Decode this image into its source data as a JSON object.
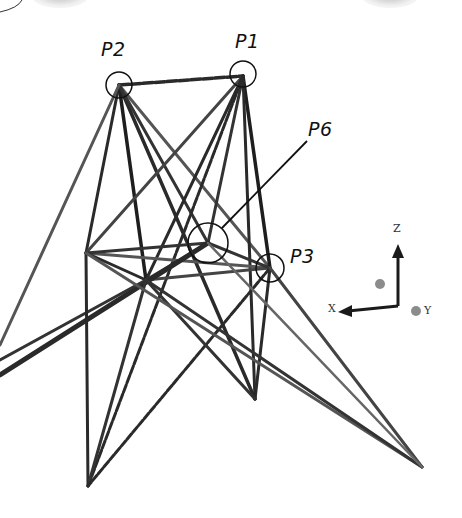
{
  "figure": {
    "type": "3d-truss-wireframe",
    "labels": {
      "p1": "P1",
      "p2": "P2",
      "p3": "P3",
      "p6": "P6"
    },
    "axes": {
      "x": "X",
      "y": "Y",
      "z": "Z"
    },
    "colors": {
      "member": "#2a2a2a",
      "member_light": "#777777",
      "axis_arrow": "#1a1a1a",
      "axis_ball": "#8c8c8c",
      "background": "#ffffff"
    },
    "nodes": [
      {
        "id": "P1",
        "x": 243,
        "y": 76,
        "circled": true
      },
      {
        "id": "P2",
        "x": 119,
        "y": 85,
        "circled": true
      },
      {
        "id": "P3",
        "x": 270,
        "y": 268,
        "circled": true
      },
      {
        "id": "P6",
        "x": 208,
        "y": 243,
        "circled": true
      },
      {
        "id": "N4",
        "x": 86,
        "y": 253,
        "circled": false
      },
      {
        "id": "N5",
        "x": 146,
        "y": 280,
        "circled": false
      },
      {
        "id": "B1",
        "x": 88,
        "y": 486,
        "circled": false
      },
      {
        "id": "B2",
        "x": 255,
        "y": 399,
        "circled": false
      },
      {
        "id": "B3",
        "x": 422,
        "y": 467,
        "circled": false
      },
      {
        "id": "B4",
        "x": 0,
        "y": 370,
        "circled": false
      }
    ]
  }
}
